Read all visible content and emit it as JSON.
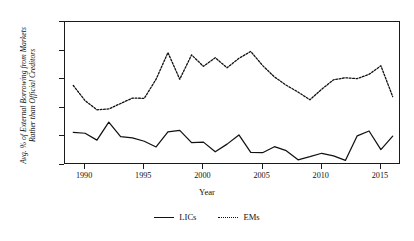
{
  "chart_data": {
    "type": "line",
    "title": "",
    "xlabel": "Year",
    "ylabel": "Avg. % of External Borrowing from Markets Rather than Official Creditors",
    "ylabel_line1": "Avg. % of External Borrowing from Markets",
    "ylabel_line2": "Rather than Official Creditors",
    "xlim": [
      1988.3,
      2016.7
    ],
    "ylim": [
      0,
      50
    ],
    "grid": false,
    "legend_position": "bottom",
    "y_ticks": [
      0,
      10,
      20,
      30,
      40,
      50
    ],
    "y_tick_labels": [
      "0%",
      "10%",
      "20%",
      "30%",
      "40%",
      "50%"
    ],
    "x_ticks": [
      1990,
      1995,
      2000,
      2005,
      2010,
      2015
    ],
    "x_tick_labels": [
      "1990",
      "1995",
      "2000",
      "2005",
      "2010",
      "2015"
    ],
    "x": [
      1989,
      1990,
      1991,
      1992,
      1993,
      1994,
      1995,
      1996,
      1997,
      1998,
      1999,
      2000,
      2001,
      2002,
      2003,
      2004,
      2005,
      2006,
      2007,
      2008,
      2009,
      2010,
      2011,
      2012,
      2013,
      2014,
      2015,
      2016
    ],
    "series": [
      {
        "name": "LICs",
        "style": "solid",
        "color": "#111111",
        "values": [
          11.4,
          11.1,
          8.7,
          15.0,
          9.9,
          9.5,
          8.3,
          6.3,
          11.6,
          12.1,
          7.8,
          8.0,
          4.6,
          7.3,
          10.5,
          4.4,
          4.3,
          6.4,
          5.0,
          1.8,
          2.9,
          4.1,
          3.2,
          1.6,
          10.2,
          11.9,
          5.4,
          10.1
        ]
      },
      {
        "name": "EMs",
        "style": "dotted",
        "color": "#111111",
        "values": [
          27.8,
          22.5,
          19.3,
          19.6,
          21.5,
          23.4,
          23.3,
          30.0,
          39.3,
          30.0,
          38.5,
          34.5,
          37.5,
          34.0,
          37.3,
          39.7,
          34.8,
          30.8,
          27.9,
          25.5,
          22.8,
          26.5,
          29.8,
          30.5,
          30.2,
          31.7,
          34.7,
          23.9
        ]
      }
    ]
  },
  "legend": {
    "items": [
      {
        "label": "LICs",
        "style": "solid"
      },
      {
        "label": "EMs",
        "style": "dotted"
      }
    ]
  }
}
